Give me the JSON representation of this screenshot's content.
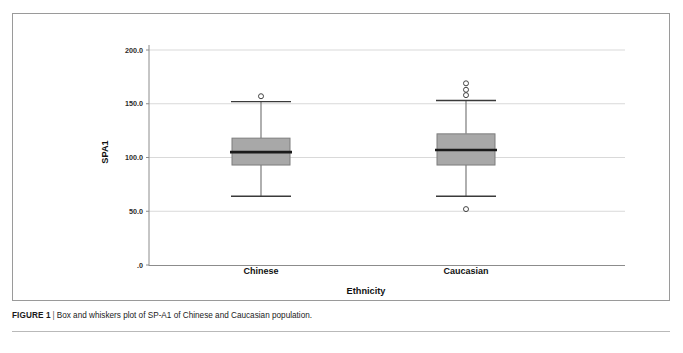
{
  "figure": {
    "caption_label": "FIGURE 1",
    "caption_separator": "|",
    "caption_text": "Box and whiskers plot of SP-A1 of Chinese and Caucasian population.",
    "frame_color": "#9a9a9a",
    "background_color": "#ffffff"
  },
  "chart_data": {
    "type": "box",
    "title": "",
    "xlabel": "Ethnicity",
    "ylabel": "SPA1",
    "categories": [
      "Chinese",
      "Caucasian"
    ],
    "ylim": [
      0,
      210
    ],
    "yticks": [
      0,
      50,
      100,
      150,
      200
    ],
    "ytick_labels": [
      ".0",
      "50.0",
      "100.0",
      "150.0",
      "200.0"
    ],
    "grid": true,
    "grid_color": "#d9d9d9",
    "legend": "none",
    "box_fill_color": "#a8a8a8",
    "box_edge_color": "#7d7d7d",
    "median_color": "#1a1a1a",
    "whisker_color": "#6e6e6e",
    "outlier_marker": "open-circle",
    "series": [
      {
        "name": "Chinese",
        "whisker_low": 64,
        "q1": 93,
        "median": 105,
        "q3": 118,
        "whisker_high": 152,
        "outliers": [
          157
        ]
      },
      {
        "name": "Caucasian",
        "whisker_low": 64,
        "q1": 93,
        "median": 107,
        "q3": 122,
        "whisker_high": 153,
        "outliers": [
          158,
          163,
          169,
          52
        ]
      }
    ]
  }
}
